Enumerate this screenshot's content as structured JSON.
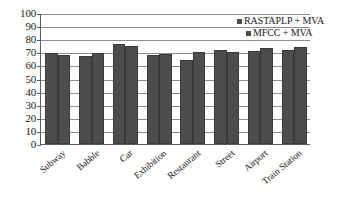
{
  "chart_data": {
    "type": "bar",
    "title": "",
    "subtitle": "",
    "xlabel": "",
    "ylabel": "",
    "ylim": [
      0,
      100
    ],
    "ytick_step": 10,
    "ytick_labels": [
      "100",
      "90",
      "80",
      "70",
      "60",
      "50",
      "40",
      "30",
      "20",
      "10",
      "0"
    ],
    "grid": true,
    "legend_position": "top-right-inside",
    "categories": [
      "Subway",
      "Babble",
      "Car",
      "Exhibition",
      "Restaurant",
      "Street",
      "Airport",
      "Train Station"
    ],
    "series": [
      {
        "name": "RASTAPLP + MVA",
        "color": "#4d4d4d",
        "values": [
          69.5,
          67.5,
          76.0,
          68.0,
          64.5,
          72.0,
          71.0,
          72.0
        ]
      },
      {
        "name": "MFCC + MVA",
        "color": "#4d4d4d",
        "values": [
          68.0,
          69.5,
          74.5,
          68.5,
          70.0,
          70.5,
          73.5,
          74.0
        ]
      }
    ]
  },
  "legend": {
    "entries": [
      {
        "label": "RASTAPLP + MVA",
        "swatch_name": "legend-swatch-rastaplp-mva"
      },
      {
        "label": "MFCC + MVA",
        "swatch_name": "legend-swatch-mfcc-mva"
      }
    ]
  },
  "axis": {
    "y_axis_name": "value-axis",
    "x_axis_name": "category-axis"
  }
}
